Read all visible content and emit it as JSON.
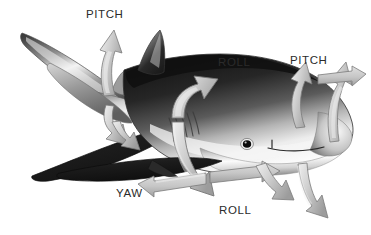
{
  "figure": {
    "background_color": "#ffffff",
    "width": 371,
    "height": 235
  },
  "labels": [
    {
      "id": "pitch-tail",
      "text": "PITCH",
      "x": 86,
      "y": 9,
      "name": "label-pitch-tail"
    },
    {
      "id": "roll-dorsal",
      "text": "ROLL",
      "x": 218,
      "y": 57,
      "name": "label-roll-dorsal"
    },
    {
      "id": "pitch-head",
      "text": "PITCH",
      "x": 290,
      "y": 55,
      "name": "label-pitch-head"
    },
    {
      "id": "yaw",
      "text": "YAW",
      "x": 116,
      "y": 188,
      "name": "label-yaw"
    },
    {
      "id": "roll-belly",
      "text": "ROLL",
      "x": 219,
      "y": 205,
      "name": "label-roll-belly"
    }
  ],
  "colors": {
    "background": "#ffffff",
    "label_text": "#2b2b2b",
    "arrow_fill_light": "#d8d8d8",
    "arrow_fill_mid": "#bfbfbf",
    "arrow_fill_dark": "#9a9a9a",
    "arrow_stroke": "#777777",
    "shark_dark": "#1d1d1d",
    "shark_mid": "#6e6e6e",
    "shark_light": "#e6e6e6",
    "shark_belly": "#fbfbfb",
    "shark_outline": "#3a3a3a",
    "eye": "#101010"
  },
  "shark": {
    "parts": [
      "upper-caudal-lobe",
      "lower-caudal-lobe",
      "caudal-peduncle",
      "body",
      "first-dorsal-fin",
      "second-dorsal-fin",
      "pectoral-fin-near",
      "pectoral-fin-far",
      "pelvic-fin",
      "gill-slits",
      "eye",
      "mouth",
      "snout",
      "belly"
    ],
    "gill_slit_count": 5
  },
  "arrows": {
    "count": 10,
    "groups": [
      {
        "axis": "PITCH",
        "location": "tail",
        "type": "curved-double",
        "direction": "up-and-down"
      },
      {
        "axis": "ROLL",
        "location": "midbody",
        "type": "curved-double",
        "direction": "over-and-under"
      },
      {
        "axis": "PITCH",
        "location": "head",
        "type": "curved-double",
        "direction": "up-and-down"
      },
      {
        "axis": "YAW",
        "location": "belly",
        "type": "straight-double",
        "direction": "left-and-right"
      },
      {
        "axis": "ROLL",
        "location": "belly",
        "type": "curved-double",
        "direction": "down"
      }
    ]
  }
}
